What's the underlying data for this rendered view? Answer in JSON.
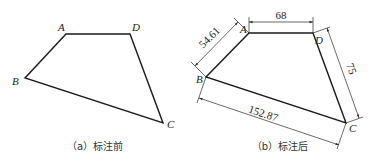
{
  "figure_a": {
    "caption": "（a）标注前",
    "vertices": {
      "A": {
        "label": "A",
        "x": 66,
        "y": 34
      },
      "D": {
        "label": "D",
        "x": 130,
        "y": 34
      },
      "B": {
        "label": "B",
        "x": 25,
        "y": 78
      },
      "C": {
        "label": "C",
        "x": 163,
        "y": 123
      }
    }
  },
  "figure_b": {
    "caption": "（b）标注后",
    "vertices": {
      "A": {
        "label": "A",
        "x": 249,
        "y": 33
      },
      "D": {
        "label": "D",
        "x": 313,
        "y": 33
      },
      "B": {
        "label": "B",
        "x": 206,
        "y": 77
      },
      "C": {
        "label": "C",
        "x": 346,
        "y": 123
      }
    },
    "dimensions": {
      "AD": "68",
      "AB": "54.61",
      "DC": "75",
      "BC": "152.87"
    }
  }
}
